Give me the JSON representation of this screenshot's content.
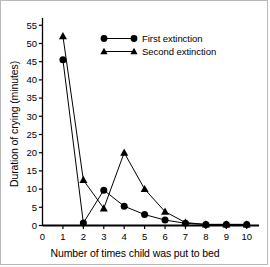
{
  "chart_data": {
    "type": "line",
    "title": "",
    "xlabel": "Number of times child was put to bed",
    "ylabel": "Duration of crying (minutes)",
    "x": [
      1,
      2,
      3,
      4,
      5,
      6,
      7,
      8,
      9,
      10
    ],
    "xlim": [
      0,
      10.6
    ],
    "ylim": [
      0,
      57
    ],
    "xticks": [
      0,
      1,
      2,
      3,
      4,
      5,
      6,
      7,
      8,
      9,
      10
    ],
    "xtick_labels": [
      "0",
      "1",
      "2",
      "3",
      "4",
      "5",
      "6",
      "7",
      "8",
      "9",
      "10"
    ],
    "yticks": [
      0,
      5,
      10,
      15,
      20,
      25,
      30,
      35,
      40,
      45,
      50,
      55
    ],
    "ytick_labels": [
      "0",
      "5",
      "10",
      "15",
      "20",
      "25",
      "30",
      "35",
      "40",
      "45",
      "50",
      "55"
    ],
    "grid": false,
    "legend_position": "upper center",
    "series": [
      {
        "name": "First extinction",
        "marker": "circle",
        "color": "#000000",
        "values": [
          45.5,
          0.7,
          9.7,
          5.3,
          3.0,
          1.5,
          0.6,
          0.3,
          0.3,
          0.3
        ]
      },
      {
        "name": "Second extinction",
        "marker": "triangle",
        "color": "#000000",
        "values": [
          52.0,
          12.5,
          4.7,
          20.0,
          10.0,
          3.8,
          0.8,
          0.3,
          0.3,
          0.3
        ]
      }
    ]
  },
  "figure": {
    "border_color": "#b9b9b9",
    "background": "#ffffff",
    "axis_color": "#000000"
  },
  "legend": {
    "items": [
      {
        "label": "First extinction"
      },
      {
        "label": "Second extinction"
      }
    ]
  }
}
